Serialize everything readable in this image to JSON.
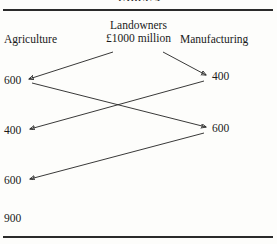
{
  "figure": {
    "title_partial": "TABLE 4",
    "columns": {
      "left_label": "Agriculture",
      "center_label_line1": "Landowners",
      "center_label_line2": "£1000 million",
      "right_label": "Manufacturing"
    },
    "left_values": [
      {
        "text": "600",
        "y": 80
      },
      {
        "text": "400",
        "y": 130
      },
      {
        "text": "600",
        "y": 180
      },
      {
        "text": "900",
        "y": 218
      }
    ],
    "right_values": [
      {
        "text": "400",
        "y": 76
      },
      {
        "text": "600",
        "y": 128
      }
    ],
    "flows": [
      {
        "name": "landowners-to-agriculture-600",
        "x1": 113,
        "y1": 52,
        "x2": 29,
        "y2": 79
      },
      {
        "name": "landowners-to-manufacturing-400",
        "x1": 163,
        "y1": 52,
        "x2": 206,
        "y2": 75
      },
      {
        "name": "agriculture-600-to-manufacturing-600",
        "x1": 32,
        "y1": 83,
        "x2": 206,
        "y2": 127
      },
      {
        "name": "manufacturing-400-to-agriculture-400",
        "x1": 204,
        "y1": 81,
        "x2": 30,
        "y2": 129
      },
      {
        "name": "manufacturing-600-to-agriculture-600",
        "x1": 204,
        "y1": 133,
        "x2": 30,
        "y2": 179
      }
    ],
    "colors": {
      "rule": "#2a2a2a",
      "line": "#232323",
      "text": "#1a1a1a",
      "background": "#fdfdfb"
    }
  }
}
